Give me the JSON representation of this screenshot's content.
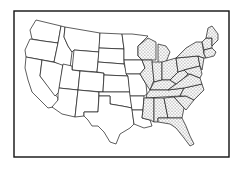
{
  "map": {
    "subject": "Contiguous United States",
    "style": "black-and-white line drawing",
    "line_color": "#1a1a1a",
    "background": "#ffffff",
    "stipple_color": "#222222",
    "shaded_region": "States east of the Mississippi River (stippled)",
    "legend": null,
    "title": null
  }
}
